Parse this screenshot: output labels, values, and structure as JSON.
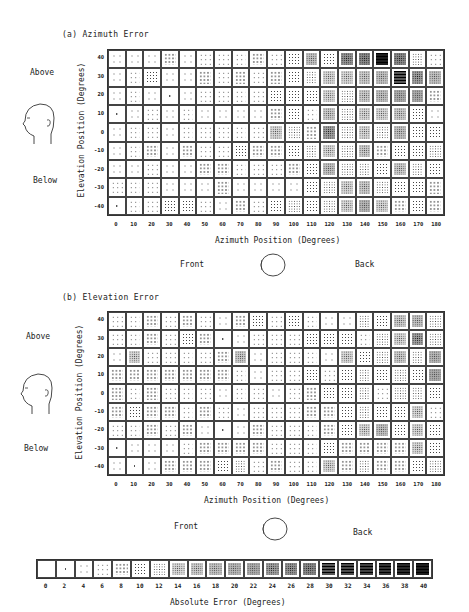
{
  "panels": [
    {
      "id": "a",
      "title": "(a) Azimuth Error",
      "above_label": "Above",
      "below_label": "Below",
      "ylabel": "Elevation Position (Degrees)",
      "xlabel": "Azimuth Position (Degrees)",
      "front_label": "Front",
      "back_label": "Back"
    },
    {
      "id": "b",
      "title": "(b) Elevation Error",
      "above_label": "Above",
      "below_label": "Below",
      "ylabel": "Elevation Position (Degrees)",
      "xlabel": "Azimuth Position (Degrees)",
      "front_label": "Front",
      "back_label": "Back"
    }
  ],
  "legend": {
    "title": "Absolute Error (Degrees)",
    "ticks": [
      "0",
      "2",
      "4",
      "6",
      "8",
      "10",
      "12",
      "14",
      "16",
      "18",
      "20",
      "22",
      "24",
      "26",
      "28",
      "30",
      "32",
      "34",
      "36",
      "38",
      "40"
    ]
  },
  "chart_data": [
    {
      "type": "heatmap",
      "title": "(a) Azimuth Error",
      "xlabel": "Azimuth Position (Degrees)",
      "ylabel": "Elevation Position (Degrees)",
      "x": [
        0,
        10,
        20,
        30,
        40,
        50,
        60,
        70,
        80,
        90,
        100,
        110,
        120,
        130,
        140,
        150,
        160,
        170,
        180
      ],
      "y": [
        40,
        30,
        20,
        10,
        0,
        -10,
        -20,
        -30,
        -40
      ],
      "colorbar": {
        "label": "Absolute Error (Degrees)",
        "range": [
          0,
          40
        ],
        "step": 2
      },
      "values": [
        [
          4,
          4,
          4,
          8,
          4,
          6,
          6,
          6,
          8,
          6,
          10,
          18,
          10,
          26,
          28,
          40,
          28,
          12,
          6
        ],
        [
          4,
          6,
          10,
          4,
          4,
          8,
          6,
          8,
          6,
          8,
          10,
          12,
          14,
          14,
          16,
          18,
          30,
          24,
          18
        ],
        [
          4,
          6,
          4,
          2,
          4,
          6,
          6,
          6,
          6,
          10,
          10,
          10,
          14,
          12,
          16,
          18,
          22,
          22,
          8
        ],
        [
          2,
          4,
          6,
          4,
          6,
          4,
          4,
          4,
          4,
          8,
          10,
          6,
          16,
          12,
          14,
          14,
          16,
          10,
          4
        ],
        [
          4,
          6,
          6,
          4,
          6,
          6,
          6,
          6,
          6,
          14,
          12,
          8,
          24,
          12,
          14,
          12,
          18,
          10,
          10
        ],
        [
          4,
          6,
          8,
          4,
          8,
          6,
          6,
          10,
          8,
          8,
          10,
          12,
          14,
          12,
          16,
          8,
          10,
          10,
          12
        ],
        [
          4,
          4,
          6,
          4,
          4,
          8,
          8,
          6,
          6,
          6,
          8,
          10,
          18,
          12,
          12,
          10,
          16,
          12,
          10
        ],
        [
          6,
          6,
          6,
          4,
          4,
          4,
          8,
          4,
          4,
          4,
          4,
          10,
          12,
          14,
          16,
          12,
          10,
          10,
          8
        ],
        [
          2,
          6,
          6,
          10,
          10,
          6,
          4,
          8,
          6,
          10,
          12,
          10,
          12,
          14,
          20,
          14,
          8,
          10,
          8
        ]
      ]
    },
    {
      "type": "heatmap",
      "title": "(b) Elevation Error",
      "xlabel": "Azimuth Position (Degrees)",
      "ylabel": "Elevation Position (Degrees)",
      "x": [
        0,
        10,
        20,
        30,
        40,
        50,
        60,
        70,
        80,
        90,
        100,
        110,
        120,
        130,
        140,
        150,
        160,
        170,
        180
      ],
      "y": [
        40,
        30,
        20,
        10,
        0,
        -10,
        -20,
        -30,
        -40
      ],
      "colorbar": {
        "label": "Absolute Error (Degrees)",
        "range": [
          0,
          40
        ],
        "step": 2
      },
      "values": [
        [
          6,
          6,
          8,
          6,
          8,
          6,
          4,
          8,
          10,
          6,
          10,
          6,
          4,
          4,
          12,
          10,
          16,
          18,
          12
        ],
        [
          6,
          6,
          8,
          6,
          10,
          8,
          2,
          4,
          6,
          6,
          6,
          10,
          10,
          10,
          6,
          12,
          14,
          24,
          12
        ],
        [
          4,
          14,
          6,
          6,
          6,
          6,
          8,
          16,
          4,
          6,
          6,
          6,
          4,
          14,
          10,
          12,
          16,
          12,
          20
        ],
        [
          8,
          8,
          8,
          8,
          8,
          8,
          8,
          6,
          4,
          6,
          6,
          10,
          6,
          10,
          12,
          10,
          12,
          10,
          22
        ],
        [
          8,
          6,
          8,
          6,
          6,
          6,
          4,
          6,
          6,
          4,
          6,
          8,
          10,
          10,
          12,
          6,
          12,
          12,
          10
        ],
        [
          8,
          10,
          8,
          8,
          6,
          8,
          6,
          4,
          6,
          6,
          6,
          8,
          8,
          10,
          12,
          10,
          10,
          14,
          6
        ],
        [
          6,
          6,
          8,
          6,
          8,
          4,
          2,
          4,
          8,
          6,
          6,
          6,
          8,
          10,
          14,
          18,
          10,
          14,
          10
        ],
        [
          2,
          4,
          4,
          4,
          6,
          8,
          8,
          8,
          8,
          6,
          6,
          6,
          10,
          8,
          8,
          8,
          8,
          14,
          10
        ],
        [
          4,
          2,
          4,
          8,
          8,
          8,
          10,
          12,
          6,
          8,
          6,
          6,
          14,
          8,
          12,
          8,
          8,
          10,
          12
        ]
      ]
    }
  ]
}
